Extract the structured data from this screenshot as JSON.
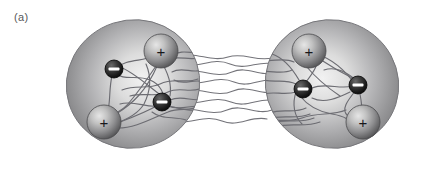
{
  "figure": {
    "panel_label": "(a)",
    "caption_text": "",
    "background_color": "#ffffff"
  },
  "diagram_data": {
    "type": "schematic",
    "title": "Two polarizable atoms coupled by fluctuating field lines",
    "canvas": {
      "width": 426,
      "height": 169
    },
    "colors": {
      "ellipse_edge": "#8c8c8e",
      "ellipse_core": "#e8e8e8",
      "ellipse_outline": "#6f6f71",
      "positive_sphere_edge": "#4c4c4e",
      "positive_sphere_core": "#d2d2d2",
      "negative_sphere_edge": "#0b0b0b",
      "negative_sphere_core": "#4a4a4a",
      "field_line": "#6e6e70",
      "bridge_line": "#7a7a7c",
      "label_text": "#58585a",
      "plus_glyph": "#17171a",
      "minus_glyph": "#ffffff"
    },
    "bodies": [
      {
        "id": "atom-left",
        "name": "left-atom-cloud",
        "shape": "ellipse",
        "cx": 133,
        "cy": 84,
        "rx": 67,
        "ry": 64,
        "rotation_deg": -18
      },
      {
        "id": "atom-right",
        "name": "right-atom-cloud",
        "shape": "ellipse",
        "cx": 332,
        "cy": 84,
        "rx": 67,
        "ry": 64,
        "rotation_deg": 18
      }
    ],
    "charges": [
      {
        "id": "L1",
        "atom": "atom-left",
        "sign": "+",
        "label": "+",
        "cx": 161,
        "cy": 51,
        "r": 17
      },
      {
        "id": "L2",
        "atom": "atom-left",
        "sign": "-",
        "label": "−",
        "cx": 114,
        "cy": 69,
        "r": 9
      },
      {
        "id": "L3",
        "atom": "atom-left",
        "sign": "-",
        "label": "−",
        "cx": 162,
        "cy": 102,
        "r": 9
      },
      {
        "id": "L4",
        "atom": "atom-left",
        "sign": "+",
        "label": "+",
        "cx": 104,
        "cy": 122,
        "r": 17
      },
      {
        "id": "R1",
        "atom": "atom-right",
        "sign": "+",
        "label": "+",
        "cx": 309,
        "cy": 51,
        "r": 17
      },
      {
        "id": "R2",
        "atom": "atom-right",
        "sign": "-",
        "label": "−",
        "cx": 303,
        "cy": 89,
        "r": 9
      },
      {
        "id": "R3",
        "atom": "atom-right",
        "sign": "-",
        "label": "−",
        "cx": 358,
        "cy": 85,
        "r": 9
      },
      {
        "id": "R4",
        "atom": "atom-right",
        "sign": "+",
        "label": "+",
        "cx": 363,
        "cy": 122,
        "r": 17
      }
    ],
    "counts": {
      "positive_charges": 4,
      "negative_charges": 4,
      "bridge_strands": 8
    },
    "legend": []
  }
}
